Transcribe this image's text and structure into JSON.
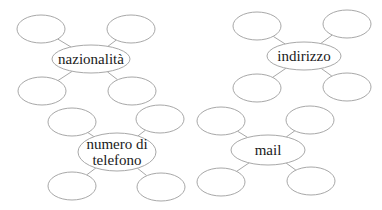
{
  "diagram": {
    "type": "spider-map-worksheet",
    "clusters": [
      {
        "id": "nazionalita",
        "label_lines": [
          "nazionalità"
        ],
        "hub": {
          "cx": 91,
          "cy": 59,
          "rx": 39,
          "ry": 14
        },
        "satellites": [
          {
            "cx": 41,
            "cy": 29,
            "rx": 24,
            "ry": 14
          },
          {
            "cx": 131,
            "cy": 29,
            "rx": 24,
            "ry": 14
          },
          {
            "cx": 42,
            "cy": 91,
            "rx": 24,
            "ry": 14
          },
          {
            "cx": 132,
            "cy": 91,
            "rx": 24,
            "ry": 14
          }
        ]
      },
      {
        "id": "indirizzo",
        "label_lines": [
          "indirizzo"
        ],
        "hub": {
          "cx": 304,
          "cy": 56,
          "rx": 37,
          "ry": 14
        },
        "satellites": [
          {
            "cx": 257,
            "cy": 26,
            "rx": 24,
            "ry": 14
          },
          {
            "cx": 347,
            "cy": 24,
            "rx": 24,
            "ry": 14
          },
          {
            "cx": 257,
            "cy": 88,
            "rx": 24,
            "ry": 14
          },
          {
            "cx": 347,
            "cy": 87,
            "rx": 24,
            "ry": 14
          }
        ]
      },
      {
        "id": "numero-di-telefono",
        "label_lines": [
          "numero di",
          "telefono"
        ],
        "hub": {
          "cx": 117,
          "cy": 152,
          "rx": 39,
          "ry": 19
        },
        "satellites": [
          {
            "cx": 72,
            "cy": 122,
            "rx": 24,
            "ry": 14
          },
          {
            "cx": 160,
            "cy": 119,
            "rx": 24,
            "ry": 14
          },
          {
            "cx": 72,
            "cy": 186,
            "rx": 24,
            "ry": 14
          },
          {
            "cx": 161,
            "cy": 187,
            "rx": 24,
            "ry": 14
          }
        ]
      },
      {
        "id": "mail",
        "label_lines": [
          "mail"
        ],
        "hub": {
          "cx": 268,
          "cy": 150,
          "rx": 37,
          "ry": 15
        },
        "satellites": [
          {
            "cx": 221,
            "cy": 121,
            "rx": 24,
            "ry": 14
          },
          {
            "cx": 310,
            "cy": 120,
            "rx": 24,
            "ry": 14
          },
          {
            "cx": 221,
            "cy": 182,
            "rx": 24,
            "ry": 14
          },
          {
            "cx": 311,
            "cy": 181,
            "rx": 24,
            "ry": 14
          }
        ]
      }
    ],
    "colors": {
      "stroke": "#a8a8a8",
      "text": "#1a1a1a",
      "background": "#ffffff"
    }
  }
}
